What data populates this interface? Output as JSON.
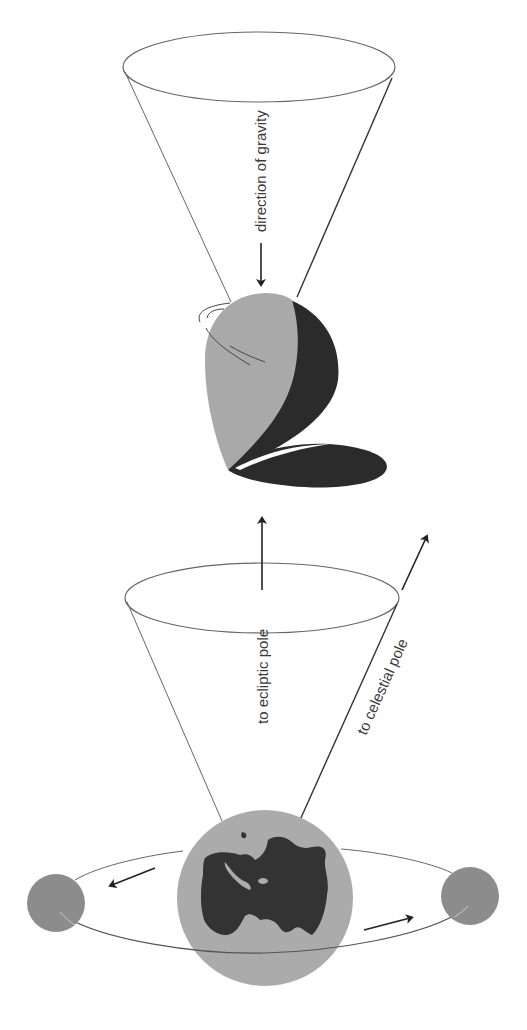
{
  "diagram": {
    "type": "precession-illustration",
    "labels": {
      "gravity": "direction of gravity",
      "ecliptic": "to ecliptic pole",
      "celestial": "to celestial pole"
    },
    "colors": {
      "light_gray": "#a9a9a9",
      "dark": "#2b2b2b",
      "moon": "#8c8c8c",
      "earth_ocean": "#ababab",
      "earth_land": "#333333",
      "line": "#555555"
    },
    "elements": {
      "top_object": "spinning top / gyroscope",
      "bottom_object": "Earth with orbiting Moon",
      "top_cone": "precession cone (top)",
      "bottom_cone": "precession cone (Earth)"
    }
  }
}
